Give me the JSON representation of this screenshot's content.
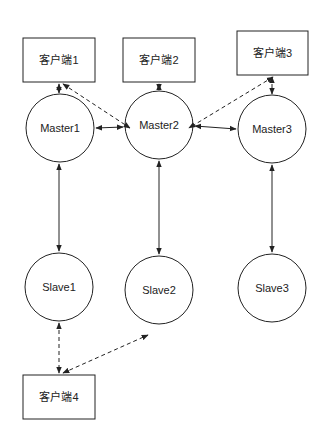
{
  "diagram": {
    "clients": [
      {
        "id": "client1",
        "label": "客户端1",
        "x": 23,
        "y": 38,
        "w": 72,
        "h": 44
      },
      {
        "id": "client2",
        "label": "客户端2",
        "x": 123,
        "y": 38,
        "w": 72,
        "h": 44
      },
      {
        "id": "client3",
        "label": "客户端3",
        "x": 237,
        "y": 31,
        "w": 71,
        "h": 44
      },
      {
        "id": "client4",
        "label": "客户端4",
        "x": 23,
        "y": 375,
        "w": 72,
        "h": 44
      }
    ],
    "masters": [
      {
        "id": "master1",
        "label": "Master1",
        "cx": 60,
        "cy": 128,
        "r": 34
      },
      {
        "id": "master2",
        "label": "Master2",
        "cx": 159,
        "cy": 125,
        "r": 34
      },
      {
        "id": "master3",
        "label": "Master3",
        "cx": 272,
        "cy": 129,
        "r": 34
      }
    ],
    "slaves": [
      {
        "id": "slave1",
        "label": "Slave1",
        "cx": 59,
        "cy": 287,
        "r": 34
      },
      {
        "id": "slave2",
        "label": "Slave2",
        "cx": 159,
        "cy": 290,
        "r": 34
      },
      {
        "id": "slave3",
        "label": "Slave3",
        "cx": 272,
        "cy": 288,
        "r": 34
      }
    ],
    "edges": [
      {
        "from": "client1",
        "to": "master1",
        "style": "dashed",
        "arrows": "both"
      },
      {
        "from": "client1",
        "to": "master2",
        "style": "dashed",
        "arrows": "both"
      },
      {
        "from": "client2",
        "to": "master2",
        "style": "dashed",
        "arrows": "both"
      },
      {
        "from": "client3",
        "to": "master2",
        "style": "dashed",
        "arrows": "both"
      },
      {
        "from": "client3",
        "to": "master3",
        "style": "dashed",
        "arrows": "both"
      },
      {
        "from": "master1",
        "to": "master2",
        "style": "solid",
        "arrows": "both"
      },
      {
        "from": "master2",
        "to": "master3",
        "style": "solid",
        "arrows": "both"
      },
      {
        "from": "master1",
        "to": "slave1",
        "style": "solid",
        "arrows": "both"
      },
      {
        "from": "master2",
        "to": "slave2",
        "style": "solid",
        "arrows": "both"
      },
      {
        "from": "master3",
        "to": "slave3",
        "style": "solid",
        "arrows": "both"
      },
      {
        "from": "slave1",
        "to": "client4",
        "style": "dashed",
        "arrows": "both"
      },
      {
        "from": "client4",
        "to": "slave2",
        "style": "dashed",
        "arrows": "both"
      }
    ],
    "colors": {
      "stroke": "#222222",
      "background": "#ffffff",
      "text": "#222222"
    }
  }
}
